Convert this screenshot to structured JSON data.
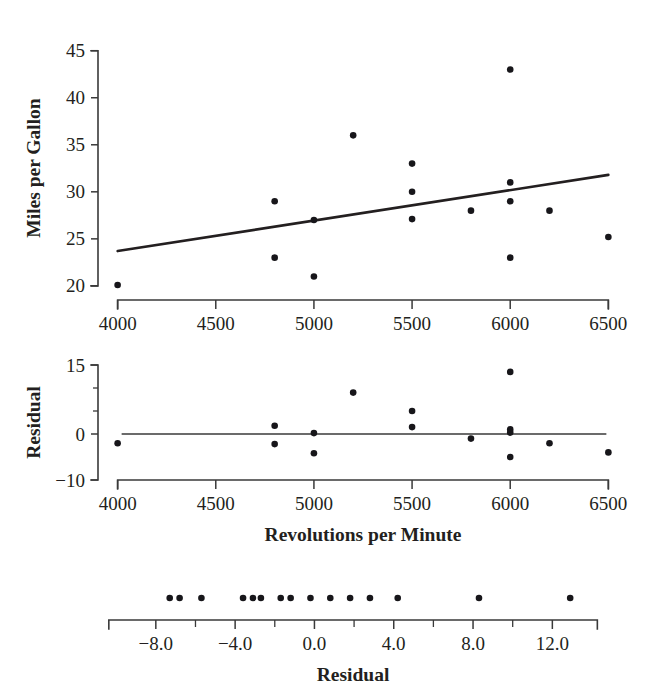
{
  "figure": {
    "background": "#ffffff",
    "ink_color": "#231f20",
    "dot_color": "#17161a"
  },
  "chart_data": [
    {
      "type": "scatter",
      "name": "mpg-vs-rpm-scatter",
      "title": "",
      "xlabel": "Revolutions per Minute",
      "ylabel": "Miles per Gallon",
      "xlim": [
        3900,
        6600
      ],
      "ylim": [
        18.5,
        45.5
      ],
      "xticks": [
        4000,
        4500,
        5000,
        5500,
        6000,
        6500
      ],
      "xtick_labels": [
        "4000",
        "4500",
        "5000",
        "5500",
        "6000",
        "6500"
      ],
      "yticks": [
        20,
        25,
        30,
        35,
        40,
        45
      ],
      "ytick_labels": [
        "20",
        "25",
        "30",
        "35",
        "40",
        "45"
      ],
      "grid": false,
      "legend": "none",
      "x": [
        4000,
        4800,
        4800,
        5000,
        5000,
        5200,
        5500,
        5500,
        5500,
        5800,
        6000,
        6000,
        6000,
        6000,
        6200,
        6500
      ],
      "y": [
        20.1,
        29.0,
        23.0,
        27.0,
        21.0,
        36.0,
        33.0,
        30.0,
        27.1,
        28.0,
        43.0,
        31.0,
        29.0,
        23.0,
        28.0,
        25.2
      ],
      "fit_line": {
        "name": "least-squares-regression-line",
        "x_start": 4000,
        "y_start": 23.7,
        "x_end": 6500,
        "y_end": 31.8
      }
    },
    {
      "type": "scatter",
      "name": "residual-vs-rpm-plot",
      "title": "",
      "xlabel": "Revolutions per Minute",
      "ylabel": "Residual",
      "xlim": [
        3900,
        6600
      ],
      "ylim": [
        -10,
        15
      ],
      "xticks": [
        4000,
        4500,
        5000,
        5500,
        6000,
        6500
      ],
      "xtick_labels": [
        "4000",
        "4500",
        "5000",
        "5500",
        "6000",
        "6500"
      ],
      "yticks": [
        -10,
        0,
        15
      ],
      "ytick_labels": [
        "-10",
        "0",
        "15"
      ],
      "yminor_ticks": [
        5,
        10
      ],
      "grid": false,
      "legend": "none",
      "reference_line_y": 0,
      "x": [
        4000,
        4800,
        4800,
        5000,
        5000,
        5200,
        5500,
        5500,
        5800,
        6000,
        6000,
        6000,
        6000,
        6200,
        6500
      ],
      "y": [
        -2.0,
        1.8,
        -2.2,
        0.2,
        -4.2,
        9.0,
        5.0,
        1.5,
        -1.0,
        13.5,
        1.0,
        0.3,
        -5.0,
        -2.0,
        -4.0
      ]
    },
    {
      "type": "dotplot",
      "name": "residual-dotplot",
      "title": "",
      "xlabel": "Residual",
      "ylabel": "",
      "xlim": [
        -9.0,
        14.0
      ],
      "xticks": [
        -8.0,
        -4.0,
        0.0,
        4.0,
        8.0,
        12.0
      ],
      "xtick_labels": [
        "−8.0",
        "−4.0",
        "0.0",
        "4.0",
        "8.0",
        "12.0"
      ],
      "xminor_ticks": [
        -6.0,
        -2.0,
        2.0,
        6.0,
        10.0
      ],
      "grid": false,
      "legend": "none",
      "values": [
        -7.3,
        -6.8,
        -5.7,
        -3.6,
        -3.1,
        -2.7,
        -1.7,
        -1.2,
        -0.2,
        0.8,
        1.8,
        2.8,
        4.2,
        8.3,
        12.9
      ]
    }
  ],
  "labels": {
    "y_axis_top": "Miles per Gallon",
    "y_axis_middle": "Residual",
    "x_axis_middle": "Revolutions per Minute",
    "x_axis_bottom": "Residual"
  }
}
